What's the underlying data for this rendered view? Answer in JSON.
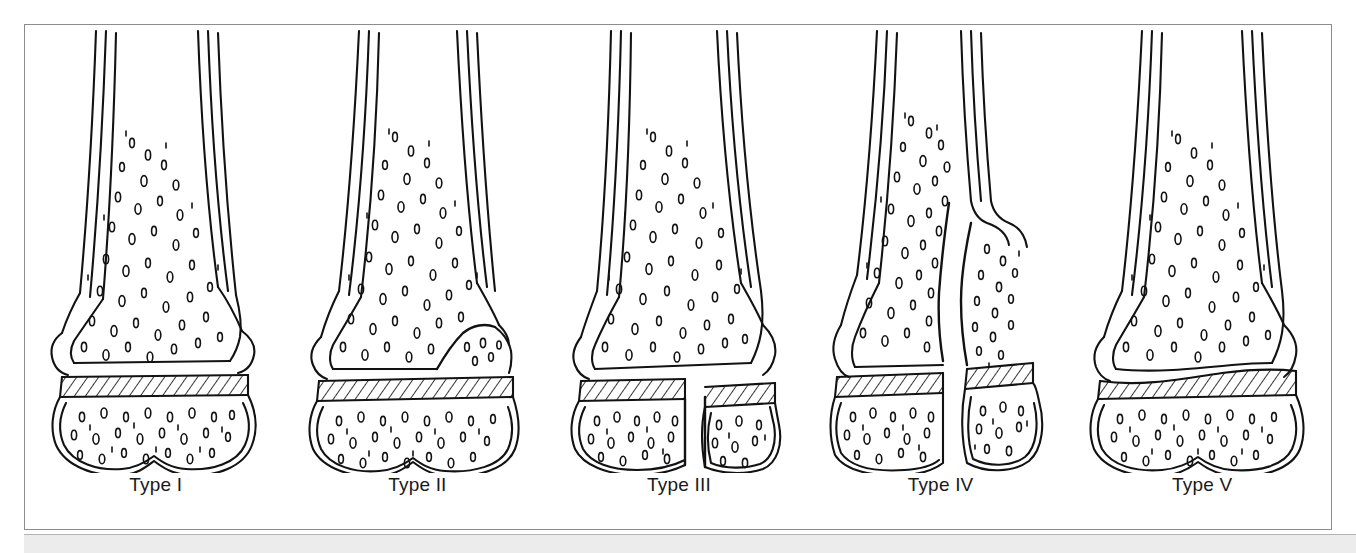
{
  "figure": {
    "caption_band_color": "#ececed",
    "frame_color": "#8c8c8c",
    "ink_color": "#121212",
    "background": "#ffffff"
  },
  "panels": [
    {
      "id": "type-1",
      "label": "Type I",
      "description": "Fracture through the physis only; epiphysis separated from metaphysis with no bony fragment",
      "physis_state": "intact-band",
      "fracture_visible": false
    },
    {
      "id": "type-2",
      "label": "Type II",
      "description": "Fracture through the physis exiting through the metaphysis, carrying a triangular metaphyseal fragment",
      "physis_state": "intact-band",
      "fracture_visible": true
    },
    {
      "id": "type-3",
      "label": "Type III",
      "description": "Fracture through the physis exiting through the epiphysis into the joint",
      "physis_state": "split-band",
      "fracture_visible": true
    },
    {
      "id": "type-4",
      "label": "Type IV",
      "description": "Fracture crossing metaphysis, physis and epiphysis as a single vertical split",
      "physis_state": "split-band",
      "fracture_visible": true
    },
    {
      "id": "type-5",
      "label": "Type V",
      "description": "Crush or compression injury of the physis with narrowing of the growth plate",
      "physis_state": "compressed-band",
      "fracture_visible": false
    }
  ]
}
